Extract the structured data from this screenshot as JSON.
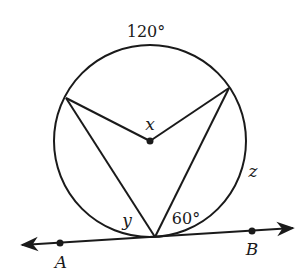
{
  "diagram": {
    "type": "circle-geometry",
    "labels": {
      "arc_top": "120°",
      "center_angle": "x",
      "arc_right": "z",
      "angle_left": "y",
      "angle_right": "60°",
      "point_a": "A",
      "point_b": "B"
    },
    "colors": {
      "stroke": "#1a1a1a",
      "background": "#ffffff"
    }
  }
}
